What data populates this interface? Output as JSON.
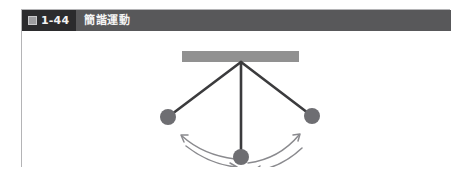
{
  "figure": {
    "badge_icon_name": "figure-glyph-icon",
    "number": "1-44",
    "title": "簡諧運動",
    "colors": {
      "header_bar": "#58585a",
      "badge": "#2b2b2d",
      "frame_border": "#b4b4b6",
      "canvas_background": "#ffffff",
      "ceiling_bar": "#919191",
      "rod": "#3b3b3d",
      "bob": "#6e6e72",
      "arrow": "#8a8a8e"
    }
  },
  "diagram": {
    "name": "simple-harmonic-motion-pendulum",
    "pivot": {
      "x": 219,
      "y": 31
    },
    "ceiling_bar": {
      "x": 160,
      "y": 20,
      "width": 117,
      "height": 11
    },
    "bobs": [
      {
        "name": "pendulum-bob-left",
        "x": 146,
        "y": 86,
        "r": 8
      },
      {
        "name": "pendulum-bob-center",
        "x": 219,
        "y": 126,
        "r": 8
      },
      {
        "name": "pendulum-bob-right",
        "x": 290,
        "y": 85,
        "r": 8
      }
    ],
    "rods": [
      {
        "name": "pendulum-rod-left",
        "x1": 219,
        "y1": 31,
        "x2": 146,
        "y2": 86
      },
      {
        "name": "pendulum-rod-center",
        "x1": 219,
        "y1": 31,
        "x2": 219,
        "y2": 126
      },
      {
        "name": "pendulum-rod-right",
        "x1": 219,
        "y1": 31,
        "x2": 290,
        "y2": 85
      }
    ],
    "arrows": [
      {
        "name": "swing-arrow-left-outward",
        "path": "M 159 104 Q 180 123 212 127",
        "arrow_at": "start",
        "direction": "toward-left-bob"
      },
      {
        "name": "swing-arrow-left-inward",
        "path": "M 163 114 Q 186 132 214 135",
        "arrow_at": "end",
        "direction": "toward-center"
      },
      {
        "name": "swing-arrow-right-outward",
        "path": "M 226 131 Q 256 127 277 104",
        "arrow_at": "end",
        "direction": "toward-right-bob"
      },
      {
        "name": "swing-arrow-right-inward",
        "path": "M 231 139 Q 258 136 279 116",
        "arrow_at": "start",
        "direction": "toward-center"
      }
    ]
  }
}
